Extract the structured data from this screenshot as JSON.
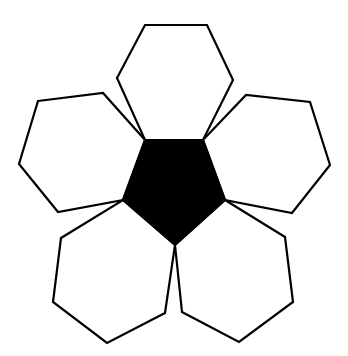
{
  "diagram": {
    "colors": {
      "background": "#ffffff",
      "pentagon_fill": "#000000",
      "hexagon_fill": "#ffffff",
      "stroke": "#000000"
    },
    "pentagon": {
      "points": "145,140 203,140 225,200 175,245 123,200"
    },
    "hexagons": [
      {
        "name": "top",
        "points": "145,25 207,25 233,80 203,140 145,140 117,78"
      },
      {
        "name": "left",
        "points": "38,101 103,93 145,140 123,200 58,212 19,164"
      },
      {
        "name": "right",
        "points": "203,140 246,95 310,102 330,165 292,213 225,200"
      },
      {
        "name": "bottom-left",
        "points": "123,200 175,245 165,313 107,343 53,302 61,238"
      },
      {
        "name": "bottom-right",
        "points": "225,200 285,237 293,302 239,342 182,312 175,245"
      }
    ]
  }
}
